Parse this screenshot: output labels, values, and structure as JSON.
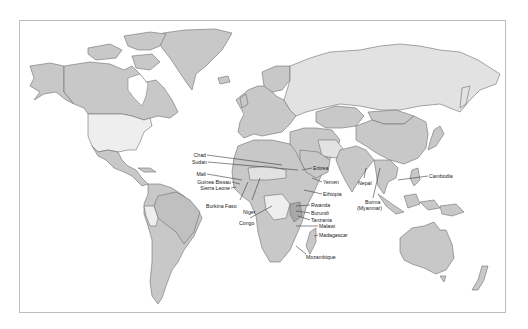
{
  "map": {
    "type": "world-political-outline",
    "colors": {
      "frame_border": "#bdbdbd",
      "background": "#ffffff",
      "land_default": "#c8c8c8",
      "land_mid": "#b5b5b5",
      "land_light": "#e2e2e2",
      "land_lightest": "#eeeeee",
      "border_stroke": "#6f6f6f",
      "label_text": "#222222"
    },
    "labels": [
      {
        "id": "chad",
        "text": "Chad"
      },
      {
        "id": "sudan",
        "text": "Sudan"
      },
      {
        "id": "mali",
        "text": "Mali"
      },
      {
        "id": "guinea-bissau",
        "text": "Guinea Bissau"
      },
      {
        "id": "sierra-leone",
        "text": "Sierra Leone"
      },
      {
        "id": "burkina-faso",
        "text": "Burkina Faso"
      },
      {
        "id": "niger",
        "text": "Niger"
      },
      {
        "id": "congo",
        "text": "Congo"
      },
      {
        "id": "eritrea",
        "text": "Eritrea"
      },
      {
        "id": "yemen",
        "text": "Yemen"
      },
      {
        "id": "ethiopia",
        "text": "Ethiopia"
      },
      {
        "id": "rwanda",
        "text": "Rwanda"
      },
      {
        "id": "burundi",
        "text": "Burundi"
      },
      {
        "id": "tanzania",
        "text": "Tanzania"
      },
      {
        "id": "malawi",
        "text": "Malawi"
      },
      {
        "id": "madagascar",
        "text": "Madagascar"
      },
      {
        "id": "mozambique",
        "text": "Mozambique"
      },
      {
        "id": "nepal",
        "text": "Nepal"
      },
      {
        "id": "burma",
        "text": "Burma"
      },
      {
        "id": "myanmar",
        "text": "(Myanmar)"
      },
      {
        "id": "cambodia",
        "text": "Cambodia"
      }
    ]
  }
}
